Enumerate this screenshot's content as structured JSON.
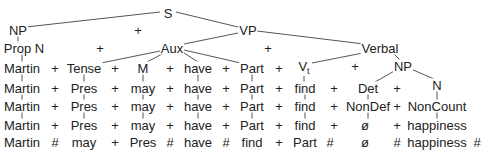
{
  "diagram": {
    "type": "phrase-structure-tree",
    "line_color": "#555555",
    "text_color": "#222222",
    "tree": {
      "root": "S",
      "level1": [
        "NP",
        "+",
        "VP"
      ],
      "level2": [
        "Prop N",
        "+",
        "Aux",
        "+",
        "Verbal"
      ],
      "verbal_children": [
        "Vt",
        "+",
        "NP"
      ],
      "np_children": [
        "Det",
        "+",
        "N"
      ]
    },
    "nodes": [
      {
        "id": "S",
        "label": "S",
        "x": 168,
        "y": 13
      },
      {
        "id": "NP_subj",
        "label": "NP",
        "x": 18,
        "y": 30
      },
      {
        "id": "plus_s",
        "label": "+",
        "x": 138,
        "y": 30
      },
      {
        "id": "VP",
        "label": "VP",
        "x": 248,
        "y": 30
      },
      {
        "id": "PropN",
        "label": "Prop N",
        "x": 24,
        "y": 48
      },
      {
        "id": "plus_l2a",
        "label": "+",
        "x": 100,
        "y": 48
      },
      {
        "id": "Aux",
        "label": "Aux",
        "x": 172,
        "y": 48
      },
      {
        "id": "plus_l2b",
        "label": "+",
        "x": 268,
        "y": 48
      },
      {
        "id": "Verbal",
        "label": "Verbal",
        "x": 380,
        "y": 48
      },
      {
        "id": "plus_l3v",
        "label": "+",
        "x": 355,
        "y": 66
      },
      {
        "id": "NP_obj",
        "label": "NP",
        "x": 403,
        "y": 66
      },
      {
        "id": "N",
        "label": "N",
        "x": 437,
        "y": 85
      }
    ],
    "rows": [
      {
        "y": 68,
        "items": [
          {
            "label": "Martin",
            "x": 22
          },
          {
            "label": "+",
            "x": 55,
            "op": true
          },
          {
            "label": "Tense",
            "x": 84
          },
          {
            "label": "+",
            "x": 115,
            "op": true
          },
          {
            "label": "M",
            "x": 143
          },
          {
            "label": "+",
            "x": 170,
            "op": true
          },
          {
            "label": "have",
            "x": 198
          },
          {
            "label": "+",
            "x": 226,
            "op": true
          },
          {
            "label": "Part",
            "x": 252
          },
          {
            "label": "+",
            "x": 279,
            "op": true
          },
          {
            "label": "V",
            "sub": "t",
            "x": 304
          }
        ]
      },
      {
        "y": 88,
        "items": [
          {
            "label": "Martin",
            "x": 22
          },
          {
            "label": "+",
            "x": 55,
            "op": true
          },
          {
            "label": "Pres",
            "x": 84
          },
          {
            "label": "+",
            "x": 115,
            "op": true
          },
          {
            "label": "may",
            "x": 143
          },
          {
            "label": "+",
            "x": 170,
            "op": true
          },
          {
            "label": "have",
            "x": 198
          },
          {
            "label": "+",
            "x": 226,
            "op": true
          },
          {
            "label": "Part",
            "x": 252
          },
          {
            "label": "+",
            "x": 279,
            "op": true
          },
          {
            "label": "find",
            "x": 305
          },
          {
            "label": "+",
            "x": 334,
            "op": true
          },
          {
            "label": "Det",
            "x": 368
          },
          {
            "label": "+",
            "x": 397,
            "op": true
          }
        ]
      },
      {
        "y": 106,
        "items": [
          {
            "label": "Martin",
            "x": 22
          },
          {
            "label": "+",
            "x": 55,
            "op": true
          },
          {
            "label": "Pres",
            "x": 84
          },
          {
            "label": "+",
            "x": 115,
            "op": true
          },
          {
            "label": "may",
            "x": 143
          },
          {
            "label": "+",
            "x": 170,
            "op": true
          },
          {
            "label": "have",
            "x": 198
          },
          {
            "label": "+",
            "x": 226,
            "op": true
          },
          {
            "label": "Part",
            "x": 252
          },
          {
            "label": "+",
            "x": 279,
            "op": true
          },
          {
            "label": "find",
            "x": 305
          },
          {
            "label": "+",
            "x": 334,
            "op": true
          },
          {
            "label": "NonDef",
            "x": 368
          },
          {
            "label": "+",
            "x": 397,
            "op": true
          },
          {
            "label": "NonCount",
            "x": 437
          }
        ]
      },
      {
        "y": 125,
        "items": [
          {
            "label": "Martin",
            "x": 22
          },
          {
            "label": "+",
            "x": 55,
            "op": true
          },
          {
            "label": "Pres",
            "x": 84
          },
          {
            "label": "+",
            "x": 115,
            "op": true
          },
          {
            "label": "may",
            "x": 143
          },
          {
            "label": "+",
            "x": 170,
            "op": true
          },
          {
            "label": "have",
            "x": 198
          },
          {
            "label": "+",
            "x": 226,
            "op": true
          },
          {
            "label": "Part",
            "x": 252
          },
          {
            "label": "+",
            "x": 279,
            "op": true
          },
          {
            "label": "find",
            "x": 305
          },
          {
            "label": "+",
            "x": 334,
            "op": true
          },
          {
            "label": "ø",
            "x": 365
          },
          {
            "label": "+",
            "x": 397,
            "op": true
          },
          {
            "label": "happiness",
            "x": 437
          }
        ]
      },
      {
        "y": 142,
        "items": [
          {
            "label": "Martin",
            "x": 22
          },
          {
            "label": "#",
            "x": 55,
            "op": true
          },
          {
            "label": "may",
            "x": 84
          },
          {
            "label": "+",
            "x": 115,
            "op": true
          },
          {
            "label": "Pres",
            "x": 143
          },
          {
            "label": "#",
            "x": 170,
            "op": true
          },
          {
            "label": "have",
            "x": 198
          },
          {
            "label": "#",
            "x": 226,
            "op": true
          },
          {
            "label": "find",
            "x": 252
          },
          {
            "label": "+",
            "x": 279,
            "op": true
          },
          {
            "label": "Part",
            "x": 305
          },
          {
            "label": "#",
            "x": 330,
            "op": true
          },
          {
            "label": "ø",
            "x": 365
          },
          {
            "label": "#",
            "x": 397,
            "op": true
          },
          {
            "label": "happiness",
            "x": 437
          },
          {
            "label": "#",
            "x": 477,
            "op": true
          }
        ]
      }
    ],
    "edges": [
      [
        160,
        12,
        26,
        27
      ],
      [
        176,
        12,
        238,
        27
      ],
      [
        257,
        31,
        364,
        44
      ],
      [
        238,
        33,
        184,
        44
      ],
      [
        18,
        35,
        18,
        43
      ],
      [
        22,
        53,
        22,
        62
      ],
      [
        160,
        51,
        96,
        64
      ],
      [
        164,
        53,
        147,
        62
      ],
      [
        181,
        51,
        198,
        62
      ],
      [
        184,
        50,
        245,
        64
      ],
      [
        368,
        52,
        312,
        63
      ],
      [
        392,
        52,
        400,
        60
      ],
      [
        396,
        70,
        375,
        82
      ],
      [
        411,
        69,
        434,
        79
      ],
      [
        22,
        74,
        22,
        82
      ],
      [
        84,
        74,
        84,
        82
      ],
      [
        143,
        74,
        143,
        82
      ],
      [
        198,
        74,
        198,
        82
      ],
      [
        252,
        74,
        252,
        82
      ],
      [
        304,
        74,
        304,
        82
      ],
      [
        22,
        93,
        22,
        100
      ],
      [
        84,
        93,
        84,
        100
      ],
      [
        143,
        93,
        143,
        100
      ],
      [
        198,
        93,
        198,
        100
      ],
      [
        252,
        93,
        252,
        100
      ],
      [
        305,
        93,
        305,
        100
      ],
      [
        368,
        93,
        368,
        100
      ],
      [
        437,
        90,
        437,
        100
      ],
      [
        22,
        111,
        22,
        119
      ],
      [
        84,
        111,
        84,
        119
      ],
      [
        143,
        111,
        143,
        119
      ],
      [
        198,
        111,
        198,
        119
      ],
      [
        252,
        111,
        252,
        119
      ],
      [
        305,
        111,
        305,
        119
      ],
      [
        368,
        111,
        368,
        119
      ],
      [
        437,
        111,
        437,
        119
      ]
    ]
  }
}
